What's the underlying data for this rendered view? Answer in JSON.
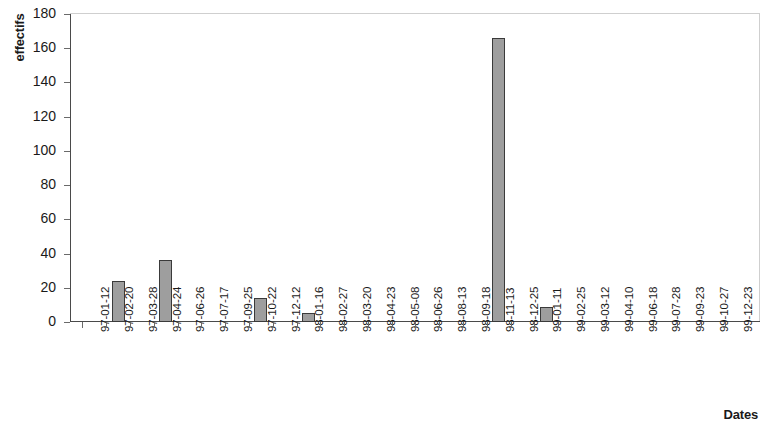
{
  "chart_data": {
    "type": "bar",
    "title": "",
    "xlabel": "Dates",
    "ylabel": "effectifs",
    "ylim": [
      0,
      180
    ],
    "ytick_step": 20,
    "yticks": [
      180,
      160,
      140,
      120,
      100,
      80,
      60,
      40,
      20,
      0
    ],
    "grid": false,
    "legend": "none",
    "bar_color": "#9e9e9e",
    "bar_border_color": "#3a3a3a",
    "axis_color": "#4a4a4a",
    "categories": [
      "97-01-12",
      "97-02-20",
      "97-03-28",
      "97-04-24",
      "97-06-26",
      "97-07-17",
      "97-09-25",
      "97-10-22",
      "97-12-12",
      "98-01-16",
      "98-02-27",
      "98-03-20",
      "98-04-23",
      "98-05-08",
      "98-06-26",
      "98-08-13",
      "98-09-18",
      "98-11-13",
      "98-12-25",
      "99-01-11",
      "99-02-25",
      "99-03-12",
      "99-04-10",
      "99-06-18",
      "99-07-28",
      "99-09-23",
      "99-10-27",
      "99-12-23"
    ],
    "values": [
      0,
      24,
      0,
      36,
      0,
      0,
      0,
      14,
      0,
      5,
      0,
      0,
      0,
      0,
      0,
      0,
      0,
      166,
      0,
      9,
      0,
      0,
      0,
      0,
      0,
      0,
      0,
      0
    ]
  }
}
